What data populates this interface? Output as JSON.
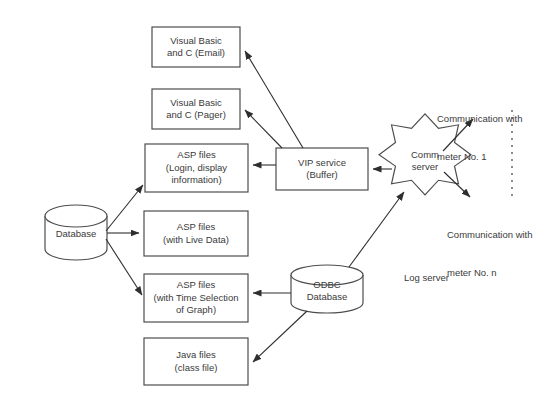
{
  "diagram": {
    "background_color": "#ffffff",
    "stroke_color": "#4d4d4d",
    "text_color": "#3a3a3a",
    "nodes": [
      {
        "id": "vb-email",
        "shape": "rectangle",
        "line1": "Visual Basic",
        "line2": "and C (Email)",
        "x": 152,
        "y": 27,
        "w": 88,
        "h": 40
      },
      {
        "id": "vb-pager",
        "shape": "rectangle",
        "line1": "Visual Basic",
        "line2": "and C (Pager)",
        "x": 152,
        "y": 89,
        "w": 88,
        "h": 40
      },
      {
        "id": "asp-login",
        "shape": "rectangle",
        "line1": "ASP files",
        "line2": "(Login, display",
        "line3": "information)",
        "x": 145,
        "y": 144,
        "w": 103,
        "h": 48
      },
      {
        "id": "asp-live-data",
        "shape": "rectangle",
        "line1": "ASP files",
        "line2": "(with Live Data)",
        "x": 144,
        "y": 211,
        "w": 104,
        "h": 45
      },
      {
        "id": "asp-time-selection",
        "shape": "rectangle",
        "line1": "ASP files",
        "line2": "(with Time Selection",
        "line3": "of Graph)",
        "x": 144,
        "y": 274,
        "w": 104,
        "h": 48
      },
      {
        "id": "java-files",
        "shape": "rectangle",
        "line1": "Java files",
        "line2": "(class file)",
        "x": 144,
        "y": 338,
        "w": 104,
        "h": 47
      },
      {
        "id": "vip-service",
        "shape": "rectangle",
        "line1": "VIP service",
        "line2": "(Buffer)",
        "x": 276,
        "y": 148,
        "w": 92,
        "h": 42
      },
      {
        "id": "comm-server",
        "shape": "star-8",
        "line1": "Comm",
        "line2": "server",
        "x": 388,
        "y": 125,
        "w": 74,
        "h": 70
      },
      {
        "id": "database",
        "shape": "cylinder",
        "line1": "Database",
        "x": 45,
        "y": 205,
        "w": 62,
        "h": 55
      },
      {
        "id": "odbc-database",
        "shape": "cylinder",
        "line1": "ODBC",
        "line2": "Database",
        "x": 291,
        "y": 265,
        "w": 72,
        "h": 48
      }
    ],
    "free_labels": [
      {
        "id": "comm-meter-1",
        "line1": "Communication with",
        "line2": "meter No. 1",
        "x": 437,
        "y": 88
      },
      {
        "id": "comm-meter-n",
        "line1": "Communication with",
        "line2": "meter No. n",
        "x": 447,
        "y": 204
      },
      {
        "id": "log-server",
        "line1": "Log server",
        "x": 404,
        "y": 247
      }
    ],
    "connectors": [
      {
        "id": "vip-to-vb-email",
        "from": "vip-service",
        "to": "vb-email",
        "style": "solid",
        "arrow": "end"
      },
      {
        "id": "vip-to-vb-pager",
        "from": "vip-service",
        "to": "vb-pager",
        "style": "solid",
        "arrow": "end"
      },
      {
        "id": "vip-to-asp-login",
        "from": "vip-service",
        "to": "asp-login",
        "style": "solid",
        "arrow": "end"
      },
      {
        "id": "comm-to-vip",
        "from": "comm-server",
        "to": "vip-service",
        "style": "solid",
        "arrow": "end"
      },
      {
        "id": "comm-to-meter-1",
        "from": "comm-server",
        "to": "comm-meter-1",
        "style": "solid",
        "arrow": "end"
      },
      {
        "id": "comm-to-meter-n",
        "from": "comm-server",
        "to": "comm-meter-n",
        "style": "solid",
        "arrow": "end"
      },
      {
        "id": "odbc-to-comm",
        "from": "odbc-database",
        "to": "comm-server",
        "style": "solid",
        "arrow": "end"
      },
      {
        "id": "db-to-asp-login",
        "from": "database",
        "to": "asp-login",
        "style": "solid",
        "arrow": "end"
      },
      {
        "id": "db-to-asp-live",
        "from": "database",
        "to": "asp-live-data",
        "style": "solid",
        "arrow": "end"
      },
      {
        "id": "db-to-asp-time",
        "from": "database",
        "to": "asp-time-selection",
        "style": "solid",
        "arrow": "end"
      },
      {
        "id": "odbc-to-asp-time",
        "from": "odbc-database",
        "to": "asp-time-selection",
        "style": "solid",
        "arrow": "end"
      },
      {
        "id": "odbc-to-java",
        "from": "odbc-database",
        "to": "java-files",
        "style": "solid",
        "arrow": "end"
      },
      {
        "id": "meter-divider",
        "from": "",
        "to": "",
        "style": "dashed-vertical",
        "arrow": "none"
      }
    ]
  }
}
